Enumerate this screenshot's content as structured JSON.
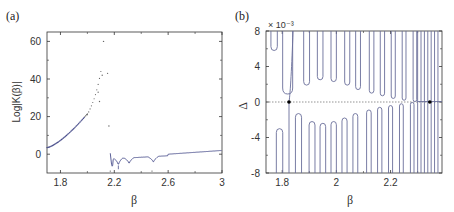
{
  "panels": {
    "a": {
      "label": "(a)",
      "xlabel": "β",
      "ylabel": "Log|K(β)|",
      "xticks": [
        "1.8",
        "2.2",
        "2.6",
        "3"
      ],
      "yticks": [
        "0",
        "20",
        "40",
        "60"
      ]
    },
    "b": {
      "label": "(b)",
      "xlabel": "β",
      "ylabel": "Δ",
      "scale_note": "× 10⁻³",
      "xticks": [
        "1.8",
        "2",
        "2.2"
      ],
      "yticks": [
        "8",
        "4",
        "0",
        "-4",
        "-8"
      ]
    }
  },
  "colors": {
    "line": "#4a4f8c",
    "axis": "#333333",
    "dots": "#555555"
  },
  "chart_data": [
    {
      "type": "scatter",
      "title": "(a)",
      "xlabel": "β",
      "ylabel": "Log|K(β)|",
      "xlim": [
        1.7,
        3.0
      ],
      "ylim": [
        -10,
        65
      ],
      "grid": false,
      "series": [
        {
          "name": "diverging branch (dots)",
          "x": [
            1.7,
            1.75,
            1.8,
            1.85,
            1.9,
            1.95,
            1.98,
            2.0,
            2.02,
            2.04,
            2.06,
            2.07,
            2.08,
            2.09,
            2.1,
            2.11,
            2.12,
            2.14,
            2.16
          ],
          "y": [
            3.5,
            5.5,
            7.5,
            9.5,
            12,
            15,
            17,
            19,
            21,
            23,
            25,
            28,
            33,
            38,
            42,
            60,
            43,
            15,
            15
          ]
        },
        {
          "name": "continuous branch (line)",
          "x": [
            2.17,
            2.18,
            2.2,
            2.22,
            2.24,
            2.26,
            2.3,
            2.34,
            2.4,
            2.44,
            2.48,
            2.52,
            2.6,
            2.7,
            2.8,
            2.9,
            3.0
          ],
          "y": [
            0,
            -5,
            -3,
            -7,
            -3,
            -2,
            -6,
            -2,
            -1,
            -2,
            -6,
            -2,
            0,
            0.5,
            1,
            1.5,
            2
          ]
        }
      ]
    },
    {
      "type": "line",
      "title": "(b)",
      "xlabel": "β",
      "ylabel": "Δ (× 10⁻³)",
      "xlim": [
        1.74,
        2.39
      ],
      "ylim": [
        -8,
        8
      ],
      "grid": false,
      "annotations": [
        "dotted horizontal line at Δ=0",
        "black markers at β≈1.83 and β≈2.34 on Δ=0"
      ],
      "upper_minima": {
        "x": [
          1.77,
          1.82,
          1.89,
          1.94,
          1.99,
          2.04,
          2.08,
          2.13,
          2.17,
          2.21,
          2.25,
          2.29
        ],
        "y": [
          5.8,
          0.9,
          1.9,
          2.5,
          2.3,
          1.9,
          1.4,
          1.0,
          0.7,
          0.4,
          0.2,
          0.05
        ]
      },
      "lower_maxima": {
        "x": [
          1.79,
          1.86,
          1.91,
          1.95,
          1.99,
          2.03,
          2.07,
          2.12,
          2.16,
          2.2,
          2.24,
          2.28
        ],
        "y": [
          -3.0,
          -1.3,
          -2.2,
          -2.4,
          -2.2,
          -1.8,
          -1.3,
          -0.9,
          -0.6,
          -0.4,
          -0.2,
          -0.05
        ]
      }
    }
  ]
}
